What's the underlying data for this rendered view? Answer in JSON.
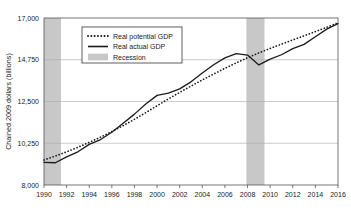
{
  "chart_data": {
    "type": "line",
    "title": "",
    "xlabel": "",
    "ylabel": "Chained 2009 dollars (billions)",
    "xlim": [
      1990,
      2016
    ],
    "ylim": [
      8000,
      17000
    ],
    "grid": true,
    "legend_position": "top-left-inside",
    "y_ticks": [
      8000,
      10250,
      12500,
      14750,
      17000
    ],
    "y_tick_labels": [
      "8,000",
      "10,250",
      "12,500",
      "14,750",
      "17,000"
    ],
    "x_ticks": [
      1990,
      1992,
      1994,
      1996,
      1998,
      2000,
      2002,
      2004,
      2006,
      2008,
      2010,
      2012,
      2014,
      2016
    ],
    "x_tick_labels": [
      "1990",
      "1992",
      "1994",
      "1996",
      "1998",
      "2000",
      "2002",
      "2004",
      "2006",
      "2008",
      "2010",
      "2012",
      "2014",
      "2016"
    ],
    "x": [
      1990,
      1991,
      1992,
      1993,
      1994,
      1995,
      1996,
      1997,
      1998,
      1999,
      2000,
      2001,
      2002,
      2003,
      2004,
      2005,
      2006,
      2007,
      2008,
      2009,
      2010,
      2011,
      2012,
      2013,
      2014,
      2015,
      2016
    ],
    "series": [
      {
        "name": "Real potential GDP",
        "style": "dotted",
        "color": "#1a1a1a",
        "values": [
          9350,
          9560,
          9790,
          10030,
          10300,
          10580,
          10880,
          11200,
          11540,
          11900,
          12270,
          12640,
          12990,
          13330,
          13660,
          13980,
          14290,
          14580,
          14860,
          15120,
          15360,
          15590,
          15820,
          16040,
          16270,
          16500,
          16740
        ]
      },
      {
        "name": "Real actual GDP",
        "style": "solid",
        "color": "#1a1a1a",
        "values": [
          9220,
          9200,
          9520,
          9790,
          10190,
          10450,
          10840,
          11330,
          11820,
          12360,
          12830,
          12950,
          13180,
          13560,
          14040,
          14480,
          14850,
          15080,
          15000,
          14470,
          14780,
          15020,
          15350,
          15580,
          15990,
          16400,
          16700
        ]
      }
    ],
    "recession_bands": [
      {
        "label": "Recession",
        "start": 1990.0,
        "end": 1991.5,
        "color": "#c8c8c8"
      },
      {
        "label": "Recession",
        "start": 2007.9,
        "end": 2009.5,
        "color": "#c8c8c8"
      }
    ],
    "legend": [
      {
        "label": "Real potential GDP",
        "marker": "dotted-line"
      },
      {
        "label": "Real actual GDP",
        "marker": "solid-line"
      },
      {
        "label": "Recession",
        "marker": "gray-swatch"
      }
    ]
  }
}
